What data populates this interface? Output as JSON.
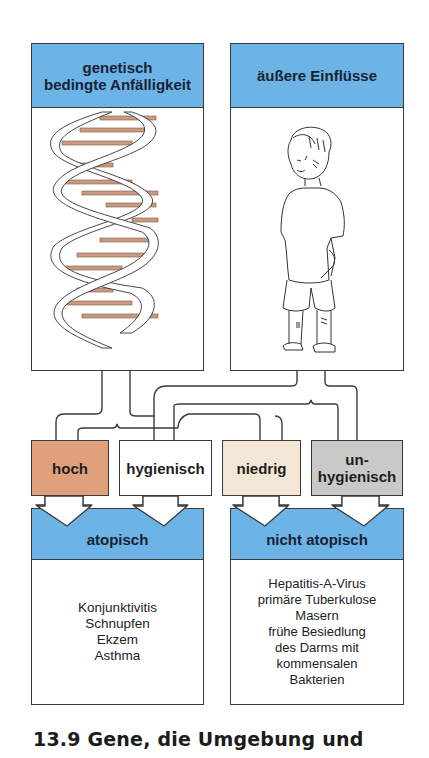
{
  "diagram": {
    "top_left": {
      "header_line1": "genetisch",
      "header_line2": "bedingte Anfälligkeit",
      "illustration": "dna-double-helix"
    },
    "top_right": {
      "header": "äußere Einflüsse",
      "illustration": "child-figure"
    },
    "factors": [
      {
        "label": "hoch",
        "color": "#e0a07c"
      },
      {
        "label": "hygienisch",
        "color": "#ffffff"
      },
      {
        "label": "niedrig",
        "color": "#f3e6d4"
      },
      {
        "label_line1": "un-",
        "label_line2": "hygienisch",
        "color": "#c9c9c9"
      }
    ],
    "outcomes": [
      {
        "header": "atopisch",
        "items": [
          "Konjunktivitis",
          "Schnupfen",
          "Ekzem",
          "Asthma"
        ]
      },
      {
        "header": "nicht atopisch",
        "items": [
          "Hepatitis-A-Virus",
          "primäre Tuberkulose",
          "Masern",
          "frühe Besiedlung",
          "des Darms mit",
          "kommensalen",
          "Bakterien"
        ]
      }
    ],
    "colors": {
      "header_blue": "#6cb4e6",
      "rung_brown": "#c99a80",
      "line": "#3a3a3a"
    }
  },
  "caption": "13.9  Gene, die Umgebung und"
}
